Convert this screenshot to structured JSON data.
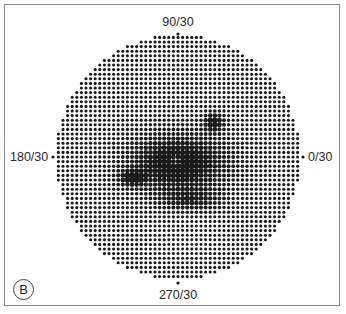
{
  "figure": {
    "panel_label": "B",
    "axis_labels": {
      "top": "90/30",
      "bottom": "270/30",
      "left": "180/30",
      "right": "0/30"
    },
    "colors": {
      "dot": "#1a1a1a",
      "frame": "#8a8a8a",
      "background": "#ffffff"
    },
    "grid": {
      "center_x": 178,
      "center_y": 157,
      "radius": 122,
      "pitch": 4.6,
      "base_dot_radius": 1.55
    },
    "dense_regions": [
      {
        "name": "central-scotoma",
        "x": 178,
        "y": 163,
        "rx": 52,
        "ry": 30,
        "strength": 1.0
      },
      {
        "name": "upper-right-spot",
        "x": 214,
        "y": 122,
        "rx": 10,
        "ry": 10,
        "strength": 0.9
      },
      {
        "name": "left-wing",
        "x": 132,
        "y": 178,
        "rx": 14,
        "ry": 8,
        "strength": 0.8
      },
      {
        "name": "lower-extension",
        "x": 190,
        "y": 200,
        "rx": 34,
        "ry": 12,
        "strength": 0.55
      }
    ],
    "light_regions": [
      {
        "name": "fixation-center",
        "x": 176,
        "y": 160,
        "rx": 6,
        "ry": 6,
        "strength": 0.6
      },
      {
        "name": "lower-field-light",
        "x": 188,
        "y": 240,
        "rx": 40,
        "ry": 20,
        "strength": 0.25
      }
    ]
  }
}
